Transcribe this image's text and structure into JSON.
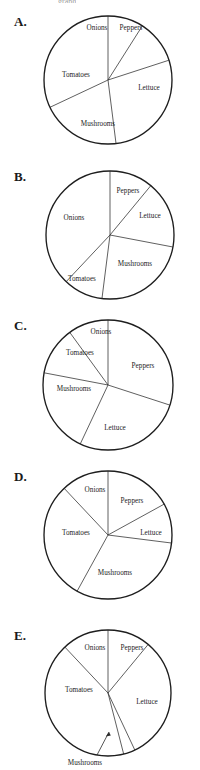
{
  "page": {
    "background_color": "#ffffff",
    "outline_color": "#1e1e1e",
    "spoke_color": "#2b2b2b",
    "text_color": "#1c1c1c",
    "cropped_header_text": "graph"
  },
  "chart_data": [
    {
      "id": "A",
      "type": "pie",
      "letter_label": "A.",
      "title": "",
      "center": [
        108,
        80
      ],
      "radius": 64,
      "categories": [
        "Onions",
        "Peppers",
        "Lettuce",
        "Mushrooms",
        "Tomatoes"
      ],
      "values": [
        9,
        11,
        28,
        20,
        32
      ],
      "start_angle_deg": -90,
      "labels": [
        {
          "name": "Onions",
          "value": 9,
          "x": 97,
          "y": 28
        },
        {
          "name": "Peppers",
          "value": 11,
          "x": 131,
          "y": 28
        },
        {
          "name": "Lettuce",
          "value": 28,
          "x": 149,
          "y": 88
        },
        {
          "name": "Mushrooms",
          "value": 20,
          "x": 98,
          "y": 124
        },
        {
          "name": "Tomatoes",
          "value": 32,
          "x": 76,
          "y": 75
        }
      ]
    },
    {
      "id": "B",
      "type": "pie",
      "letter_label": "B.",
      "title": "",
      "center": [
        110,
        235
      ],
      "radius": 64,
      "categories": [
        "Peppers",
        "Lettuce",
        "Mushrooms",
        "Tomatoes",
        "Onions"
      ],
      "values": [
        11,
        17,
        24,
        10,
        38
      ],
      "start_angle_deg": -90,
      "labels": [
        {
          "name": "Peppers",
          "value": 11,
          "x": 128,
          "y": 191
        },
        {
          "name": "Lettuce",
          "value": 17,
          "x": 150,
          "y": 216
        },
        {
          "name": "Mushrooms",
          "value": 24,
          "x": 135,
          "y": 264
        },
        {
          "name": "Tomatoes",
          "value": 10,
          "x": 82,
          "y": 279
        },
        {
          "name": "Onions",
          "value": 38,
          "x": 74,
          "y": 218
        }
      ]
    },
    {
      "id": "C",
      "type": "pie",
      "letter_label": "C.",
      "title": "",
      "center": [
        108,
        385
      ],
      "radius": 65,
      "categories": [
        "Peppers",
        "Lettuce",
        "Mushrooms",
        "Tomatoes",
        "Onions"
      ],
      "values": [
        30,
        27,
        21,
        12,
        10
      ],
      "start_angle_deg": -90,
      "labels": [
        {
          "name": "Onions",
          "value": 10,
          "x": 101,
          "y": 332
        },
        {
          "name": "Peppers",
          "value": 30,
          "x": 143,
          "y": 366
        },
        {
          "name": "Tomatoes",
          "value": 12,
          "x": 80,
          "y": 353
        },
        {
          "name": "Mushrooms",
          "value": 21,
          "x": 74,
          "y": 389
        },
        {
          "name": "Lettuce",
          "value": 27,
          "x": 115,
          "y": 428
        }
      ]
    },
    {
      "id": "D",
      "type": "pie",
      "letter_label": "D.",
      "title": "",
      "center": [
        108,
        535
      ],
      "radius": 64,
      "categories": [
        "Peppers",
        "Lettuce",
        "Mushrooms",
        "Tomatoes",
        "Onions"
      ],
      "values": [
        17,
        10,
        31,
        30,
        12
      ],
      "start_angle_deg": -90,
      "labels": [
        {
          "name": "Onions",
          "value": 12,
          "x": 95,
          "y": 490
        },
        {
          "name": "Peppers",
          "value": 17,
          "x": 132,
          "y": 501
        },
        {
          "name": "Lettuce",
          "value": 10,
          "x": 151,
          "y": 533
        },
        {
          "name": "Mushrooms",
          "value": 31,
          "x": 115,
          "y": 573
        },
        {
          "name": "Tomatoes",
          "value": 30,
          "x": 76,
          "y": 533
        }
      ]
    },
    {
      "id": "E",
      "type": "pie",
      "letter_label": "E.",
      "title": "",
      "center": [
        108,
        693
      ],
      "radius": 63,
      "categories": [
        "Peppers",
        "Lettuce",
        "Mushrooms",
        "Tomatoes",
        "Onions"
      ],
      "values": [
        11,
        32,
        3,
        42,
        12
      ],
      "start_angle_deg": -90,
      "labels": [
        {
          "name": "Onions",
          "value": 12,
          "x": 95,
          "y": 648
        },
        {
          "name": "Peppers",
          "value": 11,
          "x": 132,
          "y": 648
        },
        {
          "name": "Lettuce",
          "value": 32,
          "x": 147,
          "y": 702
        },
        {
          "name": "Tomatoes",
          "value": 42,
          "x": 79,
          "y": 690
        },
        {
          "name": "Mushrooms",
          "value": 3,
          "x": 85,
          "y": 763,
          "leader": true
        }
      ]
    }
  ]
}
